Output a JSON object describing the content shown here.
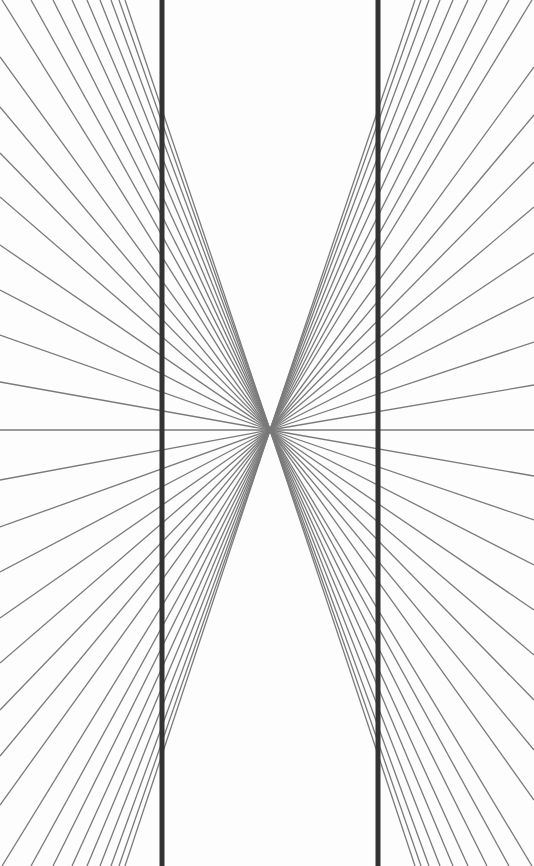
{
  "figure": {
    "width": 534,
    "height": 866,
    "center": {
      "x": 270,
      "y": 430
    },
    "colors": {
      "background": "#fdfdfd",
      "rays": "#7a7a7a",
      "bars": "#333333"
    },
    "ray_width": 1.3,
    "bar_width": 5,
    "bars_x": [
      162,
      378
    ],
    "left_rays": {
      "top_edge_x": [
        2,
        31,
        53,
        72,
        87,
        100,
        111,
        119,
        125
      ],
      "left_edge_y": [
        57,
        107,
        153,
        197,
        245,
        290,
        335,
        382,
        430,
        480,
        527,
        572,
        618,
        663,
        710,
        756,
        805
      ],
      "bottom_edge_x": [
        2,
        31,
        53,
        72,
        87,
        100,
        111,
        119,
        125
      ]
    },
    "right_rays": {
      "top_edge_x": [
        532,
        509,
        487,
        468,
        453,
        440,
        429,
        421,
        415
      ],
      "right_edge_y": [
        67,
        115,
        162,
        207,
        253,
        297,
        342,
        385,
        430,
        476,
        520,
        565,
        610,
        655,
        700,
        750,
        800
      ],
      "bottom_edge_x": [
        532,
        509,
        487,
        468,
        453,
        440,
        429,
        421,
        415
      ]
    }
  }
}
